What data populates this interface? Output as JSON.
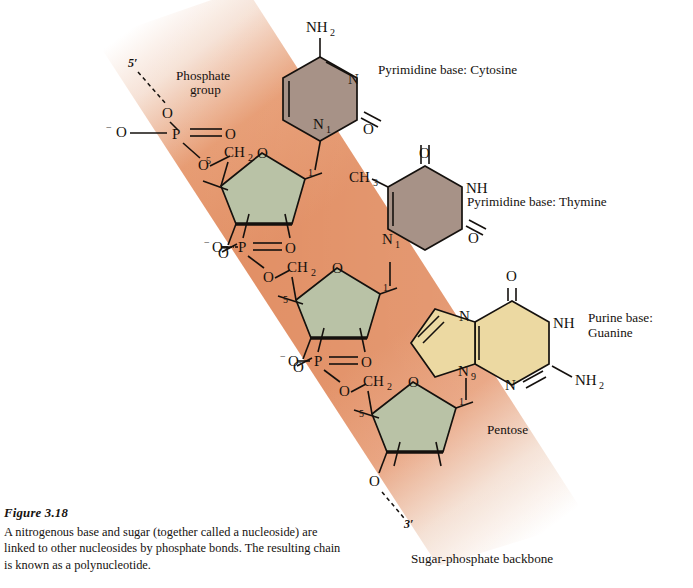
{
  "figure": {
    "number": "Figure 3.18",
    "caption": "A nitrogenous base and sugar (together called a nucleoside) are linked to other nucleosides by phosphate bonds. The resulting chain is known as a polynucleotide."
  },
  "colors": {
    "backbone_band": "#e0895c",
    "pyrimidine_ring": "#a79287",
    "purine_ring": "#ecd9a2",
    "sugar_ring": "#b9c2a6",
    "background": "#ffffff",
    "ink": "#15110e"
  },
  "annotations": {
    "five_prime": "5′",
    "three_prime": "3′",
    "phosphate_group_line1": "Phosphate",
    "phosphate_group_line2": "group",
    "pentose": "Pentose",
    "backbone": "Sugar-phosphate backbone",
    "cytosine_label": "Pyrimidine base:  Cytosine",
    "thymine_label": "Pyrimidine base:  Thymine",
    "guanine_label_line1": "Purine base:",
    "guanine_label_line2": "Guanine"
  },
  "atoms": {
    "O": "O",
    "P": "P",
    "N": "N",
    "NH": "NH",
    "NH2": "NH",
    "NH2_sub": "2",
    "CH2": "CH",
    "CH2_sub": "2",
    "CH3": "CH",
    "CH3_sub": "3",
    "minus": "−",
    "n1_sub": "1",
    "n9_sub": "9",
    "c1_sub": "1",
    "c5_sub": "5"
  },
  "structure": {
    "phosphates": [
      {
        "id": "phosphate-top",
        "label": "P",
        "terminal_oxygen": "5′"
      },
      {
        "id": "phosphate-middle",
        "label": "P"
      },
      {
        "id": "phosphate-lower",
        "label": "P"
      }
    ],
    "sugars": [
      {
        "id": "sugar-1",
        "name": "pentose",
        "ring_oxygen": "O",
        "c5": "5",
        "c1": "1"
      },
      {
        "id": "sugar-2",
        "name": "pentose",
        "ring_oxygen": "O",
        "c5": "5",
        "c1": "1"
      },
      {
        "id": "sugar-3",
        "name": "pentose",
        "ring_oxygen": "O",
        "c5": "5",
        "c1": "1"
      }
    ],
    "bases": [
      {
        "id": "base-cytosine",
        "name": "Cytosine",
        "class": "Pyrimidine",
        "attachment": "N1"
      },
      {
        "id": "base-thymine",
        "name": "Thymine",
        "class": "Pyrimidine",
        "attachment": "N1"
      },
      {
        "id": "base-guanine",
        "name": "Guanine",
        "class": "Purine",
        "attachment": "N9"
      }
    ]
  }
}
